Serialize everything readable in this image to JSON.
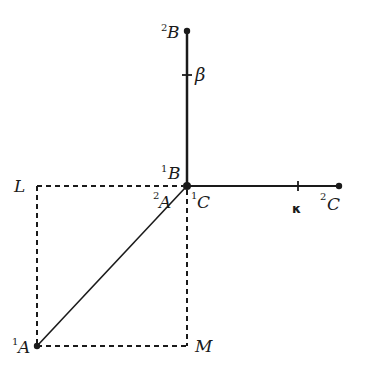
{
  "colors": {
    "ink": "#1a1a1a",
    "background": "#ffffff"
  },
  "points": {
    "origin": {
      "x": 187,
      "y": 186
    },
    "B2": {
      "x": 187,
      "y": 31
    },
    "C2": {
      "x": 339,
      "y": 186
    },
    "A1": {
      "x": 37,
      "y": 346
    },
    "L": {
      "x": 37,
      "y": 186
    },
    "M": {
      "x": 187,
      "y": 346
    }
  },
  "ticks": {
    "beta": {
      "x": 187,
      "y": 75
    },
    "kappa": {
      "x": 298,
      "y": 186
    }
  },
  "labels": {
    "B2": {
      "sup": "2",
      "main": "B"
    },
    "beta": {
      "main": "β"
    },
    "B1": {
      "sup": "1",
      "main": "B"
    },
    "A2": {
      "sup": "2",
      "main": "A"
    },
    "C1": {
      "sup": "1",
      "main": "C"
    },
    "kappa": {
      "main": "κ"
    },
    "C2": {
      "sup": "2",
      "main": "C"
    },
    "L": {
      "main": "L"
    },
    "A1": {
      "sup": "1",
      "main": "A"
    },
    "M": {
      "main": "M"
    }
  }
}
